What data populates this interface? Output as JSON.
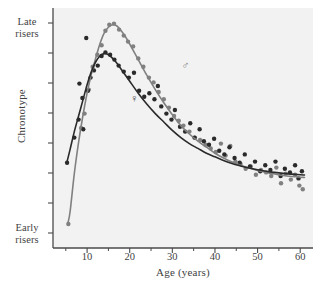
{
  "figure": {
    "background": "#ffffff",
    "plot_background": "#f2f2f2",
    "axis_color": "#4a4a4a"
  },
  "axis_labels": {
    "y_title": "Chronotype",
    "y_top_line1": "Late",
    "y_top_line2": "risers",
    "y_bottom_line1": "Early",
    "y_bottom_line2": "risers",
    "x_title": "Age (years)"
  },
  "annotations": {
    "male_symbol": "♂",
    "female_symbol": "♀"
  },
  "chart_data": {
    "type": "scatter",
    "title": "",
    "xlabel": "Age (years)",
    "ylabel": "Chronotype",
    "xlim": [
      2,
      63
    ],
    "ylim": [
      0,
      10
    ],
    "grid": false,
    "legend_position": "inline-annotations",
    "y_axis_ticks_labeled": false,
    "y_endpoint_labels": {
      "top": "Late risers",
      "bottom": "Early risers"
    },
    "x_ticks": [
      10,
      20,
      30,
      40,
      50,
      60
    ],
    "x_minor_ticks": [
      5,
      15,
      25,
      35,
      45,
      55
    ],
    "y_tick_count": 8,
    "series": [
      {
        "name": "Male",
        "symbol": "♂",
        "color": "#808080",
        "annotation_x": 33,
        "annotation_y": 7.6,
        "fit_curve": {
          "x": [
            5.5,
            6,
            7,
            8,
            9,
            10,
            11,
            12,
            13,
            14,
            15,
            16,
            17,
            18,
            19,
            20,
            22,
            24,
            26,
            28,
            30,
            32,
            34,
            36,
            38,
            40,
            42,
            44,
            46,
            48,
            50,
            52,
            54,
            56,
            58,
            60,
            61
          ],
          "y": [
            1.05,
            1.5,
            3.1,
            4.4,
            5.5,
            6.45,
            7.25,
            7.9,
            8.5,
            8.95,
            9.2,
            9.3,
            9.25,
            9.05,
            8.8,
            8.5,
            7.85,
            7.2,
            6.6,
            6.05,
            5.55,
            5.1,
            4.75,
            4.45,
            4.2,
            3.95,
            3.75,
            3.58,
            3.45,
            3.33,
            3.23,
            3.15,
            3.08,
            3.02,
            2.98,
            2.95,
            2.94
          ]
        },
        "points": [
          {
            "x": 5.6,
            "y": 1.0
          },
          {
            "x": 8.6,
            "y": 5.0
          },
          {
            "x": 9.4,
            "y": 5.6
          },
          {
            "x": 10.4,
            "y": 6.6
          },
          {
            "x": 11.3,
            "y": 7.55
          },
          {
            "x": 12.4,
            "y": 8.05
          },
          {
            "x": 13.4,
            "y": 8.45
          },
          {
            "x": 14.3,
            "y": 9.05
          },
          {
            "x": 15.2,
            "y": 9.3
          },
          {
            "x": 16.3,
            "y": 9.35
          },
          {
            "x": 17.5,
            "y": 9.1
          },
          {
            "x": 18.6,
            "y": 8.85
          },
          {
            "x": 19.6,
            "y": 8.6
          },
          {
            "x": 20.8,
            "y": 8.4
          },
          {
            "x": 22.0,
            "y": 7.9
          },
          {
            "x": 23.2,
            "y": 7.55
          },
          {
            "x": 24.5,
            "y": 7.1
          },
          {
            "x": 25.6,
            "y": 6.9
          },
          {
            "x": 26.8,
            "y": 6.5
          },
          {
            "x": 28.0,
            "y": 6.2
          },
          {
            "x": 29.2,
            "y": 5.85
          },
          {
            "x": 30.4,
            "y": 5.5
          },
          {
            "x": 31.5,
            "y": 5.3
          },
          {
            "x": 32.6,
            "y": 5.1
          },
          {
            "x": 34.0,
            "y": 4.85
          },
          {
            "x": 35.3,
            "y": 4.6
          },
          {
            "x": 36.5,
            "y": 4.5
          },
          {
            "x": 37.8,
            "y": 4.3
          },
          {
            "x": 39.0,
            "y": 4.15
          },
          {
            "x": 40.2,
            "y": 4.0
          },
          {
            "x": 41.4,
            "y": 4.35
          },
          {
            "x": 42.5,
            "y": 3.85
          },
          {
            "x": 43.6,
            "y": 4.25
          },
          {
            "x": 44.8,
            "y": 3.6
          },
          {
            "x": 46.0,
            "y": 3.5
          },
          {
            "x": 47.2,
            "y": 3.3
          },
          {
            "x": 48.4,
            "y": 3.4
          },
          {
            "x": 49.6,
            "y": 3.05
          },
          {
            "x": 50.8,
            "y": 3.25
          },
          {
            "x": 52.0,
            "y": 3.15
          },
          {
            "x": 53.2,
            "y": 3.0
          },
          {
            "x": 54.4,
            "y": 3.35
          },
          {
            "x": 55.5,
            "y": 2.7
          },
          {
            "x": 56.6,
            "y": 3.1
          },
          {
            "x": 57.8,
            "y": 2.85
          },
          {
            "x": 58.8,
            "y": 3.05
          },
          {
            "x": 59.8,
            "y": 2.6
          },
          {
            "x": 60.6,
            "y": 2.45
          }
        ]
      },
      {
        "name": "Female",
        "symbol": "♀",
        "color": "#2a2a2a",
        "annotation_x": 21,
        "annotation_y": 6.2,
        "fit_curve": {
          "x": [
            5.3,
            6,
            7,
            8,
            9,
            10,
            11,
            12,
            13,
            14,
            15,
            16,
            17,
            18,
            19,
            20,
            22,
            24,
            26,
            28,
            30,
            32,
            34,
            36,
            38,
            40,
            42,
            44,
            46,
            48,
            50,
            52,
            54,
            56,
            58,
            60,
            61
          ],
          "y": [
            3.6,
            4.1,
            4.85,
            5.5,
            6.15,
            6.8,
            7.35,
            7.75,
            8.0,
            8.1,
            8.05,
            7.9,
            7.7,
            7.45,
            7.2,
            6.95,
            6.45,
            6.0,
            5.6,
            5.25,
            4.9,
            4.6,
            4.35,
            4.15,
            3.95,
            3.8,
            3.65,
            3.52,
            3.42,
            3.33,
            3.26,
            3.2,
            3.15,
            3.11,
            3.08,
            3.05,
            3.04
          ]
        },
        "points": [
          {
            "x": 5.3,
            "y": 3.55
          },
          {
            "x": 7.0,
            "y": 4.6
          },
          {
            "x": 8.0,
            "y": 5.35
          },
          {
            "x": 8.2,
            "y": 6.85
          },
          {
            "x": 8.9,
            "y": 6.25
          },
          {
            "x": 9.1,
            "y": 4.95
          },
          {
            "x": 9.8,
            "y": 8.75
          },
          {
            "x": 10.2,
            "y": 6.55
          },
          {
            "x": 10.8,
            "y": 7.1
          },
          {
            "x": 11.6,
            "y": 7.4
          },
          {
            "x": 12.5,
            "y": 7.6
          },
          {
            "x": 13.4,
            "y": 8.0
          },
          {
            "x": 14.3,
            "y": 8.15
          },
          {
            "x": 15.4,
            "y": 8.05
          },
          {
            "x": 16.4,
            "y": 7.85
          },
          {
            "x": 17.4,
            "y": 7.6
          },
          {
            "x": 18.6,
            "y": 7.35
          },
          {
            "x": 19.8,
            "y": 7.1
          },
          {
            "x": 21.0,
            "y": 7.3
          },
          {
            "x": 22.2,
            "y": 6.55
          },
          {
            "x": 23.4,
            "y": 6.3
          },
          {
            "x": 24.6,
            "y": 6.45
          },
          {
            "x": 25.8,
            "y": 6.2
          },
          {
            "x": 26.6,
            "y": 6.75
          },
          {
            "x": 27.4,
            "y": 5.9
          },
          {
            "x": 28.6,
            "y": 5.6
          },
          {
            "x": 29.8,
            "y": 5.35
          },
          {
            "x": 30.6,
            "y": 5.75
          },
          {
            "x": 31.8,
            "y": 5.05
          },
          {
            "x": 33.0,
            "y": 4.85
          },
          {
            "x": 34.2,
            "y": 5.2
          },
          {
            "x": 35.2,
            "y": 4.6
          },
          {
            "x": 36.4,
            "y": 4.95
          },
          {
            "x": 37.4,
            "y": 4.45
          },
          {
            "x": 38.6,
            "y": 4.3
          },
          {
            "x": 39.8,
            "y": 4.55
          },
          {
            "x": 41.0,
            "y": 4.05
          },
          {
            "x": 42.2,
            "y": 3.9
          },
          {
            "x": 43.4,
            "y": 4.2
          },
          {
            "x": 44.6,
            "y": 3.75
          },
          {
            "x": 45.8,
            "y": 3.55
          },
          {
            "x": 47.0,
            "y": 3.9
          },
          {
            "x": 48.2,
            "y": 3.4
          },
          {
            "x": 49.4,
            "y": 3.6
          },
          {
            "x": 50.6,
            "y": 3.2
          },
          {
            "x": 51.8,
            "y": 3.45
          },
          {
            "x": 53.0,
            "y": 3.25
          },
          {
            "x": 54.2,
            "y": 3.6
          },
          {
            "x": 55.4,
            "y": 3.0
          },
          {
            "x": 56.4,
            "y": 3.3
          },
          {
            "x": 57.6,
            "y": 3.15
          },
          {
            "x": 58.8,
            "y": 3.45
          },
          {
            "x": 59.6,
            "y": 2.9
          },
          {
            "x": 60.4,
            "y": 3.2
          }
        ]
      }
    ]
  }
}
